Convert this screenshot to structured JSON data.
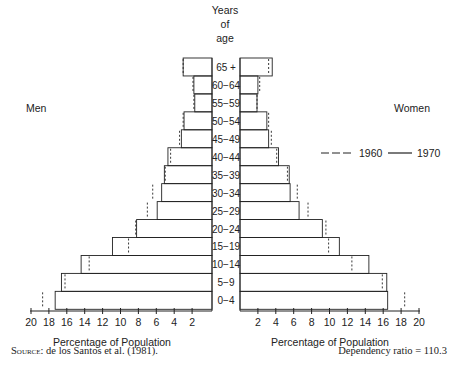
{
  "chart_data": {
    "type": "bar",
    "subtype": "population-pyramid",
    "title": "",
    "center_header": [
      "Years",
      "of",
      "age"
    ],
    "left_label": "Men",
    "right_label": "Women",
    "xlabel_left": "Percentage of Population",
    "xlabel_right": "Percentage of Population",
    "xlim": [
      0,
      20
    ],
    "x_ticks_left": [
      20,
      18,
      16,
      14,
      12,
      10,
      8,
      6,
      4,
      2
    ],
    "x_ticks_right": [
      2,
      4,
      6,
      8,
      10,
      12,
      14,
      16,
      18,
      20
    ],
    "categories": [
      "65+",
      "60-64",
      "55-59",
      "50-54",
      "45-49",
      "40-44",
      "35-39",
      "30-34",
      "25-29",
      "20-24",
      "15-19",
      "10-14",
      "5-9",
      "0-4"
    ],
    "legend": [
      {
        "label": "1960",
        "style": "dashed"
      },
      {
        "label": "1970",
        "style": "solid"
      }
    ],
    "legend_position": "right",
    "series": [
      {
        "name": "Men 1970",
        "side": "left",
        "style": "solid",
        "values": [
          3.0,
          1.8,
          1.7,
          2.9,
          3.2,
          4.7,
          5.1,
          5.4,
          5.9,
          8.2,
          10.9,
          14.4,
          16.6,
          17.3
        ]
      },
      {
        "name": "Men 1960",
        "side": "left",
        "style": "dashed",
        "values": [
          3.0,
          1.9,
          1.8,
          3.0,
          3.4,
          4.4,
          5.0,
          6.4,
          7.0,
          8.3,
          9.1,
          13.5,
          16.2,
          18.7
        ]
      },
      {
        "name": "Women 1970",
        "side": "right",
        "style": "solid",
        "values": [
          3.6,
          2.0,
          1.9,
          3.0,
          3.2,
          4.3,
          5.5,
          5.6,
          6.6,
          9.2,
          11.1,
          14.4,
          16.4,
          16.5
        ]
      },
      {
        "name": "Women 1960",
        "side": "right",
        "style": "dashed",
        "values": [
          3.2,
          2.2,
          1.9,
          3.2,
          3.5,
          4.1,
          5.3,
          6.4,
          7.6,
          9.6,
          9.9,
          12.5,
          15.9,
          18.4
        ]
      }
    ],
    "grid": false
  },
  "footer": {
    "source_prefix": "Source:",
    "source_text": " de los Santos et al. (1981).",
    "dependency_ratio": "Dependency ratio = 110.3"
  },
  "colors": {
    "line": "#222222",
    "background": "#ffffff"
  }
}
